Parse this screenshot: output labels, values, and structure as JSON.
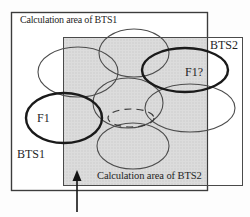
{
  "diagram": {
    "bts1_area_title": "Calculation area of BTS1",
    "bts2_area_title": "Calculation area of BTS2",
    "bts1_label": "BTS1",
    "bts2_label": "BTS2",
    "f1_cell_label": "F1",
    "f1_question_cell_label": "F1?",
    "colors": {
      "overlap_shade": "#d8d8d8",
      "thin_line": "#4d4d4d",
      "bold_line": "#1a1a1a",
      "rect_border": "#3c3c3c",
      "text": "#1f1f1f",
      "background": "#ffffff"
    }
  }
}
